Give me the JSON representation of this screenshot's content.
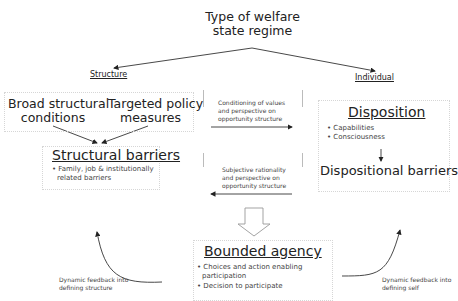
{
  "diagram": {
    "root": {
      "line1": "Type of welfare",
      "line2": "state regime"
    },
    "branches": {
      "structure": "Structure",
      "individual": "Individual"
    },
    "structure_inputs": [
      {
        "line1": "Broad structural",
        "line2": "conditions"
      },
      {
        "line1": "Targeted policy",
        "line2": "measures"
      }
    ],
    "structural_barriers": {
      "heading": "Structural barriers",
      "bullets": [
        "• Family, job & institutionally",
        "related barriers"
      ]
    },
    "middle_top": {
      "lines": [
        "Conditioning of values",
        "and perspective on",
        "opportunity structure"
      ],
      "arrow_direction": "right"
    },
    "middle_bottom": {
      "lines": [
        "Subjective rationality",
        "and perspective on",
        "opportunity structure"
      ],
      "arrow_direction": "left"
    },
    "disposition": {
      "heading": "Disposition",
      "bullets": [
        "• Capabilities",
        "• Consciousness"
      ]
    },
    "dispositional_barriers": {
      "label": "Dispositional barriers"
    },
    "bounded_agency": {
      "heading": "Bounded agency",
      "bullets": [
        "• Choices and action enabling",
        "participation",
        "• Decision to participate"
      ]
    },
    "feedback_left": {
      "line1": "Dynamic feedback into",
      "line2": "defining structure"
    },
    "feedback_right": {
      "line1": "Dynamic feedback into",
      "line2": "defining self"
    }
  }
}
